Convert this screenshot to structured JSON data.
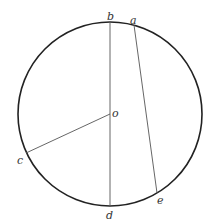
{
  "diagram": {
    "type": "circle-geometry",
    "colors": {
      "circle": "#222222",
      "lines": "#555555",
      "labels": "#333333"
    },
    "circle": {
      "cx": 110,
      "cy": 114,
      "r": 92
    },
    "points": {
      "b": {
        "label": "b",
        "x": 110,
        "y": 22
      },
      "a": {
        "label": "a",
        "x": 134,
        "y": 25
      },
      "o": {
        "label": "o",
        "x": 110,
        "y": 114
      },
      "c": {
        "label": "c",
        "x": 26,
        "y": 153
      },
      "d": {
        "label": "d",
        "x": 110,
        "y": 206
      },
      "e": {
        "label": "e",
        "x": 157,
        "y": 193
      }
    },
    "segments": [
      {
        "name": "bd",
        "from": "b",
        "to": "d"
      },
      {
        "name": "ae",
        "from": "a",
        "to": "e"
      },
      {
        "name": "oc",
        "from": "o",
        "to": "c"
      }
    ]
  }
}
